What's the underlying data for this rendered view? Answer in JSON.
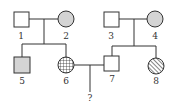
{
  "colors": {
    "line": "#333333",
    "unaffected_fill": "#ffffff",
    "gray_fill": "#d4d4d4"
  },
  "legend_note": "",
  "individuals": [
    {
      "id": "1",
      "label": "1",
      "sex": "male",
      "fill": "none"
    },
    {
      "id": "2",
      "label": "2",
      "sex": "female",
      "fill": "gray"
    },
    {
      "id": "3",
      "label": "3",
      "sex": "male",
      "fill": "none"
    },
    {
      "id": "4",
      "label": "4",
      "sex": "female",
      "fill": "gray"
    },
    {
      "id": "5",
      "label": "5",
      "sex": "male",
      "fill": "gray"
    },
    {
      "id": "6",
      "label": "6",
      "sex": "female",
      "fill": "grid"
    },
    {
      "id": "7",
      "label": "7",
      "sex": "male",
      "fill": "none"
    },
    {
      "id": "8",
      "label": "8",
      "sex": "female",
      "fill": "hatch"
    }
  ],
  "unknown_child": {
    "label": "?"
  },
  "relations": [
    {
      "type": "couple",
      "members": [
        "1",
        "2"
      ],
      "children": [
        "5",
        "6"
      ]
    },
    {
      "type": "couple",
      "members": [
        "3",
        "4"
      ],
      "children": [
        "7",
        "8"
      ]
    },
    {
      "type": "couple",
      "members": [
        "6",
        "7"
      ],
      "children": [
        "?"
      ]
    }
  ]
}
